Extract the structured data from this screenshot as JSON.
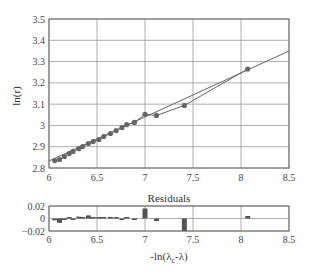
{
  "chart_data": [
    {
      "type": "scatter",
      "title": "",
      "xlabel": "",
      "ylabel": "ln(r)",
      "xlim": [
        6,
        8.5
      ],
      "ylim": [
        2.8,
        3.5
      ],
      "xticks": [
        "6",
        "6.5",
        "7",
        "7.5",
        "8",
        "8.5"
      ],
      "yticks": [
        "2.8",
        "2.9",
        "3",
        "3.1",
        "3.2",
        "3.3",
        "3.4",
        "3.5"
      ],
      "grid": true,
      "series": [
        {
          "name": "data",
          "style": "line+markers",
          "x": [
            6.06,
            6.11,
            6.16,
            6.21,
            6.25,
            6.31,
            6.35,
            6.41,
            6.46,
            6.52,
            6.57,
            6.64,
            6.7,
            6.76,
            6.81,
            6.89,
            7.0,
            7.12,
            7.41,
            8.07
          ],
          "y": [
            2.835,
            2.84,
            2.854,
            2.868,
            2.878,
            2.891,
            2.901,
            2.915,
            2.924,
            2.934,
            2.948,
            2.962,
            2.976,
            2.99,
            3.004,
            3.014,
            3.052,
            3.047,
            3.094,
            3.265
          ]
        },
        {
          "name": "linear fit",
          "style": "line",
          "x": [
            6.0,
            8.5
          ],
          "y": [
            2.833,
            3.35
          ]
        }
      ]
    },
    {
      "type": "bar",
      "title": "Residuals",
      "xlabel": "-ln(λc-λ)",
      "ylabel": "",
      "xlim": [
        6,
        8.5
      ],
      "ylim": [
        -0.02,
        0.02
      ],
      "xticks": [
        "6",
        "6.5",
        "7",
        "7.5",
        "8",
        "8.5"
      ],
      "yticks": [
        "0.02",
        "0",
        "-0.02"
      ],
      "grid": true,
      "x": [
        6.06,
        6.11,
        6.16,
        6.21,
        6.25,
        6.31,
        6.35,
        6.41,
        6.46,
        6.52,
        6.57,
        6.64,
        6.7,
        6.76,
        6.81,
        6.89,
        7.0,
        7.12,
        7.41,
        8.07
      ],
      "values": [
        -0.003,
        -0.007,
        -0.002,
        0.001,
        -0.001,
        0.003,
        0.001,
        0.005,
        0.001,
        0.001,
        0.002,
        0.001,
        0.0,
        -0.001,
        0.001,
        -0.002,
        0.016,
        -0.004,
        -0.02,
        0.004
      ]
    }
  ],
  "labels": {
    "ylabel": "ln(r)",
    "residuals_title": "Residuals",
    "xlabel_main": "-ln(λ",
    "xlabel_sub": "c",
    "xlabel_end": "-λ)"
  }
}
